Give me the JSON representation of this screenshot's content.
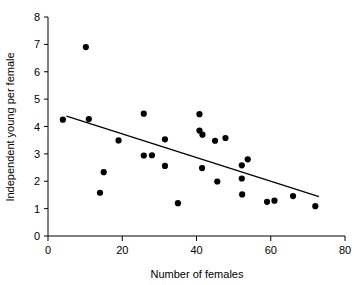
{
  "chart_data": {
    "type": "scatter",
    "title": "",
    "xlabel": "Number of females",
    "ylabel": "Independent young per female",
    "xlim": [
      0,
      80
    ],
    "ylim": [
      0,
      8
    ],
    "xticks": [
      0,
      20,
      40,
      60,
      80
    ],
    "yticks": [
      0,
      1,
      2,
      3,
      4,
      5,
      6,
      7,
      8
    ],
    "xtick_labels": [
      "0",
      "20",
      "40",
      "60",
      "80"
    ],
    "ytick_labels": [
      "0",
      "1",
      "2",
      "3",
      "4",
      "5",
      "6",
      "7",
      "8"
    ],
    "grid": false,
    "legend": null,
    "marker": "filled-circle",
    "marker_color": "#000000",
    "points": [
      {
        "x": 4.0,
        "y": 4.25
      },
      {
        "x": 10.2,
        "y": 6.9
      },
      {
        "x": 11.0,
        "y": 4.27
      },
      {
        "x": 14.0,
        "y": 1.58
      },
      {
        "x": 15.0,
        "y": 2.33
      },
      {
        "x": 19.0,
        "y": 3.49
      },
      {
        "x": 25.8,
        "y": 4.47
      },
      {
        "x": 25.8,
        "y": 2.94
      },
      {
        "x": 28.0,
        "y": 2.95
      },
      {
        "x": 31.5,
        "y": 3.53
      },
      {
        "x": 31.5,
        "y": 2.56
      },
      {
        "x": 35.0,
        "y": 1.2
      },
      {
        "x": 40.8,
        "y": 4.45
      },
      {
        "x": 40.8,
        "y": 3.85
      },
      {
        "x": 41.6,
        "y": 3.7
      },
      {
        "x": 41.5,
        "y": 2.48
      },
      {
        "x": 45.0,
        "y": 3.48
      },
      {
        "x": 45.6,
        "y": 1.99
      },
      {
        "x": 47.8,
        "y": 3.58
      },
      {
        "x": 52.2,
        "y": 2.58
      },
      {
        "x": 52.2,
        "y": 2.1
      },
      {
        "x": 52.3,
        "y": 1.52
      },
      {
        "x": 53.8,
        "y": 2.8
      },
      {
        "x": 59.0,
        "y": 1.25
      },
      {
        "x": 61.0,
        "y": 1.29
      },
      {
        "x": 66.0,
        "y": 1.46
      },
      {
        "x": 72.0,
        "y": 1.09
      }
    ],
    "trend_line": {
      "x_start": 5.0,
      "y_start": 4.38,
      "x_end": 73.0,
      "y_end": 1.44,
      "style": "solid",
      "color": "#000000"
    }
  }
}
